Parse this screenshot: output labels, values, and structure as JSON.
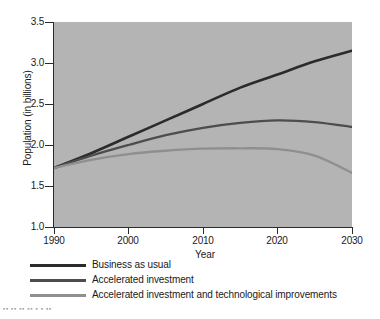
{
  "chart_data": {
    "type": "line",
    "title": "",
    "xlabel": "Year",
    "ylabel": "Population (in billions)",
    "xlim": [
      1990,
      2030
    ],
    "ylim": [
      1.0,
      3.5
    ],
    "xticks": [
      1990,
      2000,
      2010,
      2020,
      2030
    ],
    "yticks": [
      1.0,
      1.5,
      2.0,
      2.5,
      3.0,
      3.5
    ],
    "xtick_labels": [
      "1990",
      "2000",
      "2010",
      "2020",
      "2030"
    ],
    "ytick_labels": [
      "1.0",
      "1.5",
      "2.0",
      "2.5",
      "3.0",
      "3.5"
    ],
    "grid": false,
    "legend_position": "below-axes-left",
    "plot_background": "#b4b4b4",
    "x": [
      1990,
      1995,
      2000,
      2005,
      2010,
      2015,
      2020,
      2025,
      2030
    ],
    "series": [
      {
        "name": "Business as usual",
        "color": "#2b2b2b",
        "values": [
          1.72,
          1.9,
          2.1,
          2.3,
          2.5,
          2.7,
          2.86,
          3.02,
          3.15
        ]
      },
      {
        "name": "Accelerated investment",
        "color": "#4d4d4d",
        "values": [
          1.72,
          1.87,
          2.0,
          2.12,
          2.21,
          2.27,
          2.3,
          2.28,
          2.22
        ]
      },
      {
        "name": "Accelerated investment and technological improvements",
        "color": "#8f8f8f",
        "values": [
          1.72,
          1.82,
          1.89,
          1.93,
          1.955,
          1.96,
          1.95,
          1.87,
          1.66
        ]
      }
    ]
  },
  "legend": {
    "items": [
      {
        "label": "Business as usual",
        "color": "#2b2b2b"
      },
      {
        "label": "Accelerated investment",
        "color": "#4d4d4d"
      },
      {
        "label": "Accelerated investment and technological improvements",
        "color": "#8f8f8f"
      }
    ]
  },
  "artifact": {
    "text": "▪▪ ▪▪ ▪▪ ▪▪  ▪ ▪  ▪▪"
  }
}
